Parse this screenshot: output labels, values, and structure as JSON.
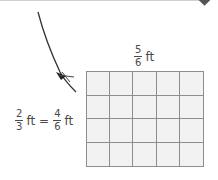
{
  "diagram": {
    "top_label": {
      "numerator": "5",
      "denominator": "6",
      "unit": "ft"
    },
    "side_label": {
      "left": {
        "numerator": "2",
        "denominator": "3",
        "unit": "ft"
      },
      "equals": "=",
      "right": {
        "numerator": "4",
        "denominator": "6",
        "unit": "ft"
      }
    },
    "grid": {
      "columns": 5,
      "rows": 4,
      "fill_color": "#f2f2f2",
      "line_color": "#8e8e8e"
    },
    "icons": [
      "pencil-icon",
      "diamond-marker-icon"
    ]
  }
}
